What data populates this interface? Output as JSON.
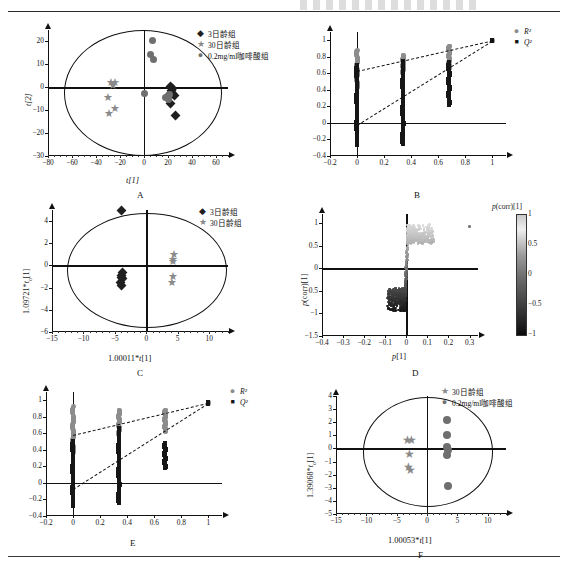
{
  "figure": {
    "panels": [
      "A",
      "B",
      "C",
      "D",
      "E",
      "F"
    ],
    "legend_labels": {
      "day3": "3日龄组",
      "day30": "30日龄组",
      "caffeic": "0.2mg/ml咖啡酸组",
      "r2": "R²",
      "q2": "Q²"
    },
    "colors": {
      "day3_marker": "#1f1f1f",
      "day30_marker": "#8a8a8a",
      "caffeic_marker": "#6f6f6f",
      "r2_marker": "#8d8d8d",
      "q2_marker": "#161616",
      "axis": "#111111"
    }
  },
  "chart_data": [
    {
      "id": "A",
      "type": "scatter",
      "title": "A",
      "xlabel": "t[1]",
      "ylabel": "t[2]",
      "xlim": [
        -80,
        70
      ],
      "ylim": [
        -30,
        25
      ],
      "xticks": [
        -80,
        -60,
        -40,
        -20,
        0,
        20,
        40,
        60
      ],
      "yticks": [
        -30,
        -20,
        -10,
        0,
        10,
        20
      ],
      "grid": false,
      "legend_position": "top-right",
      "ellipse": {
        "cx": -2,
        "cy": -2,
        "rx": 65,
        "ry": 27
      },
      "series": [
        {
          "name": "3日龄组",
          "marker": "diamond",
          "color": "#1f1f1f",
          "points": [
            [
              22,
              0.5
            ],
            [
              23.5,
              -0.5
            ],
            [
              22.5,
              -1.5
            ],
            [
              24,
              -2.5
            ],
            [
              21.5,
              -3
            ],
            [
              25,
              -3.5
            ],
            [
              22,
              -7
            ],
            [
              26,
              -12.5
            ]
          ]
        },
        {
          "name": "30日龄组",
          "marker": "star",
          "color": "#8a8a8a",
          "points": [
            [
              -30,
              3
            ],
            [
              -26,
              3
            ],
            [
              -28,
              1.5
            ],
            [
              -32,
              -3.5
            ],
            [
              -26,
              -8.5
            ],
            [
              -31,
              -10.5
            ]
          ]
        },
        {
          "name": "0.2mg/ml咖啡酸组",
          "marker": "circle",
          "color": "#6f6f6f",
          "points": [
            [
              7,
              20.5
            ],
            [
              5,
              14.5
            ],
            [
              8,
              12
            ],
            [
              0,
              -2.5
            ],
            [
              18,
              -4.5
            ],
            [
              20,
              -5.5
            ],
            [
              21,
              -3
            ]
          ]
        }
      ]
    },
    {
      "id": "B",
      "type": "scatter",
      "title": "B",
      "xlabel": "",
      "ylabel": "",
      "xlim": [
        -0.2,
        1.1
      ],
      "ylim": [
        -0.4,
        1.1
      ],
      "xticks": [
        -0.2,
        0,
        0.2,
        0.4,
        0.6,
        0.8,
        1
      ],
      "yticks": [
        -0.4,
        -0.2,
        0,
        0.2,
        0.4,
        0.6,
        0.8,
        1
      ],
      "grid": false,
      "legend_position": "top-right",
      "series": [
        {
          "name": "R²",
          "marker": "circle",
          "color": "#8d8d8d",
          "x_groups": [
            0,
            0.34,
            0.68,
            1.0
          ],
          "y_ranges": [
            [
              0.42,
              0.88
            ],
            [
              0.6,
              0.82
            ],
            [
              0.66,
              0.93
            ],
            [
              0.99,
              1.0
            ]
          ]
        },
        {
          "name": "Q²",
          "marker": "square",
          "color": "#161616",
          "x_groups": [
            0,
            0.34,
            0.68,
            1.0
          ],
          "y_ranges": [
            [
              -0.27,
              0.7
            ],
            [
              -0.25,
              0.74
            ],
            [
              0.22,
              0.73
            ],
            [
              0.99,
              1.0
            ]
          ]
        }
      ],
      "trendlines": [
        {
          "name": "R² line",
          "from": [
            0,
            0.63
          ],
          "to": [
            1.0,
            1.0
          ],
          "style": "dashed"
        },
        {
          "name": "Q² line",
          "from": [
            0,
            -0.02
          ],
          "to": [
            1.0,
            1.0
          ],
          "style": "dashed"
        }
      ]
    },
    {
      "id": "C",
      "type": "scatter",
      "title": "C",
      "xlabel": "1.00011*t[1]",
      "ylabel": "1.09721*to[1]",
      "xlim": [
        -15,
        13
      ],
      "ylim": [
        -6,
        5
      ],
      "xticks": [
        -15,
        -10,
        -5,
        0,
        5,
        10
      ],
      "yticks": [
        -6,
        -4,
        -2,
        0,
        2,
        4
      ],
      "grid": false,
      "legend_position": "top-right",
      "ellipse": {
        "cx": 0,
        "cy": -0.4,
        "rx": 12.6,
        "ry": 5.1
      },
      "series": [
        {
          "name": "3日龄组",
          "marker": "diamond",
          "color": "#1f1f1f",
          "points": [
            [
              -3.9,
              5.0
            ],
            [
              -3.8,
              -0.6
            ],
            [
              -4.0,
              -0.9
            ],
            [
              -3.8,
              -1.2
            ],
            [
              -4.1,
              -1.5
            ],
            [
              -3.9,
              -1.8
            ],
            [
              -4.0,
              -1.1
            ]
          ]
        },
        {
          "name": "30日龄组",
          "marker": "star",
          "color": "#8a8a8a",
          "points": [
            [
              4.0,
              1.2
            ],
            [
              3.8,
              0.7
            ],
            [
              3.9,
              0.5
            ],
            [
              3.9,
              -0.8
            ],
            [
              3.7,
              -1.4
            ]
          ]
        }
      ]
    },
    {
      "id": "D",
      "type": "scatter",
      "title": "D",
      "xlabel": "p[1]",
      "ylabel": "p(corr)[1]",
      "xlim": [
        -0.4,
        0.34
      ],
      "ylim": [
        -1.5,
        1.2
      ],
      "xticks": [
        -0.4,
        -0.3,
        -0.2,
        -0.1,
        0,
        0.1,
        0.2,
        0.3
      ],
      "yticks": [
        -1.5,
        -1,
        -0.5,
        0,
        0.5,
        1
      ],
      "grid": false,
      "colorbar": {
        "title": "p(corr)[1]",
        "ticks": [
          1,
          0.5,
          0,
          -0.5,
          -1
        ],
        "vmin": -1,
        "vmax": 1
      },
      "description": "S-plot; dense upper-right cluster near p(corr)≈0.9 and lower-left cluster near p(corr)≈-0.9"
    },
    {
      "id": "E",
      "type": "scatter",
      "title": "E",
      "xlabel": "",
      "ylabel": "",
      "xlim": [
        -0.2,
        1.1
      ],
      "ylim": [
        -0.4,
        1.1
      ],
      "xticks": [
        -0.2,
        0,
        0.2,
        0.4,
        0.6,
        0.8,
        1
      ],
      "yticks": [
        -0.4,
        -0.2,
        0,
        0.2,
        0.4,
        0.6,
        0.8,
        1
      ],
      "grid": false,
      "legend_position": "top-right",
      "series": [
        {
          "name": "R²",
          "marker": "circle",
          "color": "#8d8d8d",
          "x_groups": [
            0,
            0.34,
            0.68,
            1.0
          ],
          "y_ranges": [
            [
              0.36,
              0.92
            ],
            [
              0.58,
              0.88
            ],
            [
              0.62,
              0.88
            ],
            [
              0.96,
              0.98
            ]
          ]
        },
        {
          "name": "Q²",
          "marker": "square",
          "color": "#161616",
          "x_groups": [
            0,
            0.34,
            0.68,
            1.0
          ],
          "y_ranges": [
            [
              -0.28,
              0.5
            ],
            [
              -0.24,
              0.66
            ],
            [
              0.18,
              0.48
            ],
            [
              0.96,
              0.98
            ]
          ]
        }
      ],
      "trendlines": [
        {
          "name": "R² line",
          "from": [
            0,
            0.58
          ],
          "to": [
            1.0,
            0.97
          ],
          "style": "dashed"
        },
        {
          "name": "Q² line",
          "from": [
            0,
            -0.07
          ],
          "to": [
            1.0,
            0.97
          ],
          "style": "dashed"
        }
      ]
    },
    {
      "id": "F",
      "type": "scatter",
      "title": "F",
      "xlabel": "1.00053*t[1]",
      "ylabel": "1.39068*to[1]",
      "xlim": [
        -15,
        13
      ],
      "ylim": [
        -5,
        4
      ],
      "xticks": [
        -15,
        -10,
        -5,
        0,
        5,
        10
      ],
      "yticks": [
        -5,
        -4,
        -3,
        -2,
        -1,
        0,
        1,
        2,
        3,
        4
      ],
      "grid": false,
      "legend_position": "top-right",
      "ellipse": {
        "cx": 0,
        "cy": -0.2,
        "rx": 10.6,
        "ry": 4.1
      },
      "series": [
        {
          "name": "30日龄组",
          "marker": "star",
          "color": "#8a8a8a",
          "points": [
            [
              -3.6,
              0.8
            ],
            [
              -3.0,
              0.8
            ],
            [
              -3.3,
              -0.3
            ],
            [
              -3.5,
              -1.3
            ],
            [
              -3.1,
              -1.5
            ]
          ]
        },
        {
          "name": "0.2mg/ml咖啡酸组",
          "marker": "circle",
          "color": "#6f6f6f",
          "points": [
            [
              3.3,
              2.2
            ],
            [
              3.3,
              1.0
            ],
            [
              3.2,
              0.1
            ],
            [
              3.4,
              -0.1
            ],
            [
              3.3,
              -0.5
            ],
            [
              3.4,
              -2.9
            ]
          ]
        }
      ]
    }
  ]
}
